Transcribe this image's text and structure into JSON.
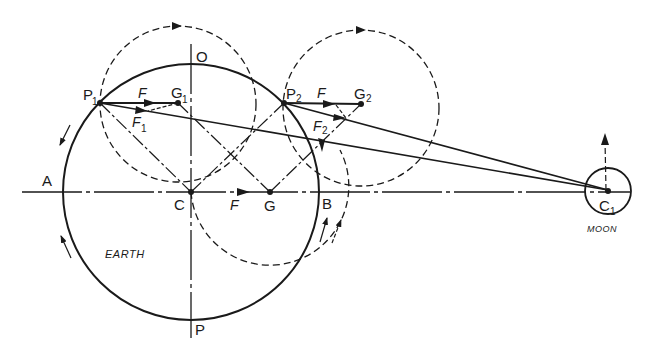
{
  "diagram": {
    "labels": {
      "O": "O",
      "P": "P",
      "A": "A",
      "B": "B",
      "C": "C",
      "G": "G",
      "P1": "P",
      "P1_sub": "1",
      "P2": "P",
      "P2_sub": "2",
      "G1": "G",
      "G1_sub": "1",
      "G2": "G",
      "G2_sub": "2",
      "C1": "C",
      "C1_sub": "1",
      "F_top1": "F",
      "F_top2": "F",
      "F_center": "F",
      "F1": "F",
      "F1_sub": "1",
      "F2": "F",
      "F2_sub": "2",
      "earth": "EARTH",
      "moon": "MOON"
    },
    "colors": {
      "ink": "#1a1a1a",
      "background": "#ffffff"
    }
  }
}
